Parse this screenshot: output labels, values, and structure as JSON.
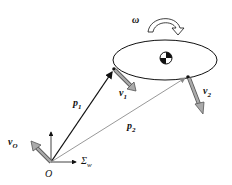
{
  "diagram": {
    "labels": {
      "omega": "ω",
      "p1": "p",
      "p1_sub": "1",
      "p2": "p",
      "p2_sub": "2",
      "v1": "v",
      "v1_sub": "1",
      "v2": "v",
      "v2_sub": "2",
      "vO": "v",
      "vO_sub": "O",
      "origin": "O",
      "frame": "Σ",
      "frame_sub": "w"
    }
  }
}
